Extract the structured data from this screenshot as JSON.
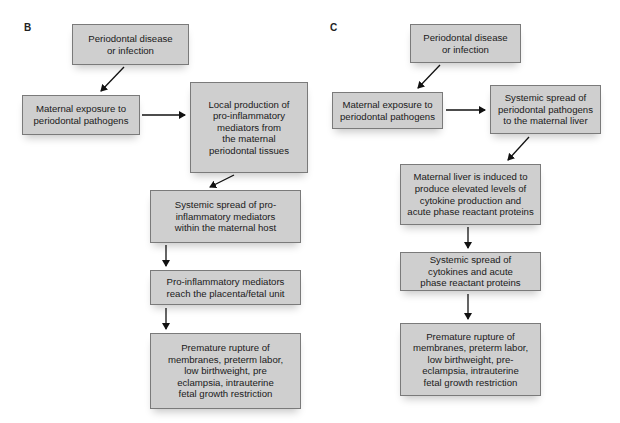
{
  "panels": [
    {
      "label": "B",
      "boxes": {
        "periodontal_disease": "Periodontal disease\nor infection",
        "maternal_exposure": "Maternal exposure to\nperiodontal pathogens",
        "local_production": "Local production of\npro-inflammatory\nmediators from\nthe maternal\nperiodontal tissues",
        "systemic_spread": "Systemic spread of pro-\ninflammatory mediators\nwithin the maternal host",
        "mediators_reach": "Pro-inflammatory mediators\nreach the placenta/fetal unit",
        "outcomes": "Premature rupture of\nmembranes, preterm labor,\nlow birthweight, pre\neclampsia, intrauterine\nfetal growth restriction"
      }
    },
    {
      "label": "C",
      "boxes": {
        "periodontal_disease": "Periodontal disease\nor infection",
        "maternal_exposure": "Maternal exposure to\nperiodontal pathogens",
        "systemic_spread_liver": "Systemic spread of\nperiodontal pathogens\nto the maternal liver",
        "liver_induced": "Maternal liver is induced to\nproduce elevated levels of\ncytokine production and\nacute phase reactant proteins",
        "cytokine_spread": "Systemic spread of\ncytokines and acute\nphase reactant proteins",
        "outcomes": "Premature rupture of\nmembranes, preterm labor,\nlow birthweight, pre-\neclampsia, intrauterine\nfetal growth restriction"
      }
    }
  ],
  "colors": {
    "box_fill": "#cfcfcf",
    "box_border": "#7a7a7a",
    "arrow": "#111111"
  }
}
